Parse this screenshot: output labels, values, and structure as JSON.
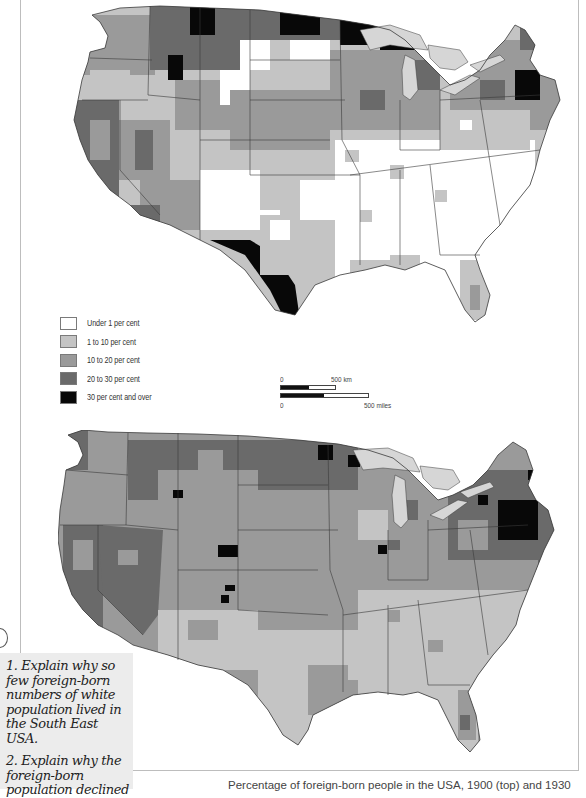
{
  "title": "Percentage of foreign-born people in the USA, 1900 (top) and 1930",
  "colors": {
    "under_1": "#ffffff",
    "1_to_10": "#c4c4c4",
    "10_to_20": "#9a9a9a",
    "20_to_30": "#6a6a6a",
    "30_and_over": "#080808",
    "lakes": "#d6d6d6",
    "border": "#3a3a3a"
  },
  "legend": {
    "items": [
      {
        "label": "Under 1 per cent",
        "color": "#ffffff"
      },
      {
        "label": "1 to 10 per cent",
        "color": "#c4c4c4"
      },
      {
        "label": "10 to 20 per cent",
        "color": "#9a9a9a"
      },
      {
        "label": "20 to 30 per cent",
        "color": "#6a6a6a"
      },
      {
        "label": "30 per cent and over",
        "color": "#080808"
      }
    ]
  },
  "scale_bar": {
    "km_start": "0",
    "km_end": "500 km",
    "miles_start": "0",
    "miles_end": "500 miles"
  },
  "maps": [
    {
      "year": "1900",
      "position": "top",
      "summary": "Foreign-born concentrated in the North (Minnesota, Dakotas, Wisconsin, Michigan, New England, Montana) and along the Mexican border of Texas; South East mostly under 1 per cent."
    },
    {
      "year": "1930",
      "position": "bottom",
      "summary": "Foreign-born share generally lower; highest in New England (Massachusetts, Rhode Island), Great Lakes industrial areas and scattered western counties; South East 1 to 10 per cent."
    }
  ],
  "questions": [
    {
      "number": "1.",
      "text": "1. Explain why so few foreign-born numbers of white population lived in the South East USA."
    },
    {
      "number": "2.",
      "text": "2. Explain why the foreign-born population declined"
    }
  ],
  "caption": "Percentage of foreign-born people in the USA, 1900 (top) and 1930"
}
